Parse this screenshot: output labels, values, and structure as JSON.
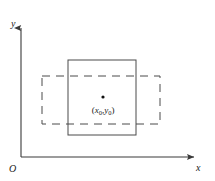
{
  "figure": {
    "background_color": "#ffffff",
    "stroke_color": "#4a4a4a",
    "axis_color": "#3a3a3a",
    "text_color": "#1a1a1a",
    "width": 215,
    "height": 181
  },
  "axes": {
    "y_label": "y",
    "x_label": "x",
    "origin_label": "O",
    "x_axis": {
      "x1": 21,
      "y1": 157,
      "x2": 196,
      "y2": 157
    },
    "y_axis": {
      "x1": 21,
      "y1": 157,
      "x2": 21,
      "y2": 26
    },
    "arrowheads": "both-ends-outward"
  },
  "shapes": {
    "solid_rectangle": {
      "name": "solid-rectangle",
      "style": "solid",
      "x": 68,
      "y": 60,
      "width": 68,
      "height": 75
    },
    "dashed_rectangle": {
      "name": "dashed-rectangle",
      "style": "dashed",
      "x": 42,
      "y": 76,
      "width": 118,
      "height": 48,
      "dash_pattern": "8 6"
    }
  },
  "point": {
    "marker_x": 103,
    "marker_y": 97,
    "marker_radius": 1.6,
    "label_x": 103,
    "label_y": 112,
    "label_open": "(",
    "var_x": "x",
    "sub_x": "0",
    "comma": ",",
    "var_y": "y",
    "sub_y": "0",
    "label_close": ")",
    "label_full": "(x0,y0)"
  }
}
